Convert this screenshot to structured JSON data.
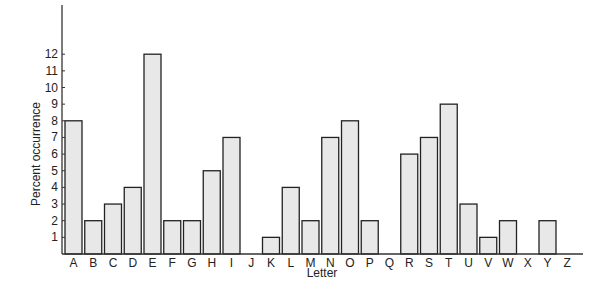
{
  "chart_data": {
    "type": "bar",
    "title": "",
    "xlabel": "Letter",
    "ylabel": "Percent occurrence",
    "ylim": [
      0,
      12
    ],
    "yticks": [
      1,
      2,
      3,
      4,
      5,
      6,
      7,
      8,
      9,
      10,
      11,
      12
    ],
    "grid": false,
    "categories": [
      "A",
      "B",
      "C",
      "D",
      "E",
      "F",
      "G",
      "H",
      "I",
      "J",
      "K",
      "L",
      "M",
      "N",
      "O",
      "P",
      "Q",
      "R",
      "S",
      "T",
      "U",
      "V",
      "W",
      "X",
      "Y",
      "Z"
    ],
    "values": [
      8,
      2,
      3,
      4,
      12,
      2,
      2,
      5,
      7,
      0,
      1,
      4,
      2,
      7,
      8,
      2,
      0,
      6,
      7,
      9,
      3,
      1,
      2,
      0,
      2,
      0
    ]
  },
  "colors": {
    "bar_fill": "#e8e8e8",
    "bar_stroke": "#222222",
    "axis": "#333333"
  }
}
